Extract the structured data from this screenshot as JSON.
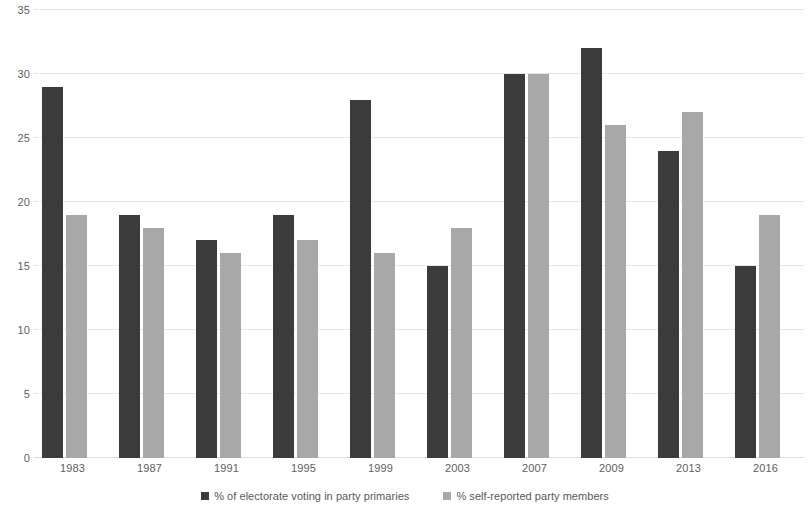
{
  "chart_data": {
    "type": "bar",
    "title": "",
    "subtitle": "",
    "xlabel": "",
    "ylabel": "",
    "categories": [
      "1983",
      "1987",
      "1991",
      "1995",
      "1999",
      "2003",
      "2007",
      "2009",
      "2013",
      "2016"
    ],
    "series": [
      {
        "name": "% of electorate voting in party primaries",
        "color": "#3b3b3b",
        "values": [
          29,
          19,
          17,
          19,
          28,
          15,
          30,
          32,
          24,
          15
        ]
      },
      {
        "name": "% self-reported party members",
        "color": "#a8a8a8",
        "values": [
          19,
          18,
          16,
          17,
          16,
          18,
          30,
          26,
          27,
          19
        ]
      }
    ],
    "ylim": [
      0,
      35
    ],
    "ytick_step": 5,
    "yticks": [
      "0",
      "5",
      "10",
      "15",
      "20",
      "25",
      "30",
      "35"
    ],
    "grid": "horizontal",
    "legend_position": "bottom",
    "annotations": []
  },
  "colors": {
    "background": "#ffffff",
    "gridline": "#e4e7ec",
    "axis_text": "#606060",
    "series_dark": "#3b3b3b",
    "series_light": "#a8a8a8"
  }
}
